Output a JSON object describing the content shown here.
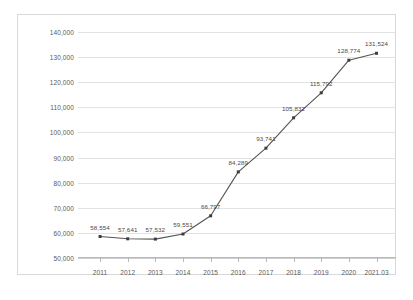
{
  "chart_data": {
    "type": "line",
    "title": "",
    "xlabel": "",
    "ylabel": "",
    "categories": [
      "2011",
      "2012",
      "2013",
      "2014",
      "2015",
      "2016",
      "2017",
      "2018",
      "2019",
      "2020",
      "2021.03"
    ],
    "values": [
      58554,
      57641,
      57532,
      59551,
      66797,
      84289,
      93741,
      105832,
      115792,
      128774,
      131524
    ],
    "value_labels": [
      "58,554",
      "57,641",
      "57,532",
      "59,551",
      "66,797",
      "84,289",
      "93,741",
      "105,832",
      "115,792",
      "128,774",
      "131,524"
    ],
    "ylim": [
      50000,
      140000
    ],
    "ytick_values": [
      50000,
      60000,
      70000,
      80000,
      90000,
      100000,
      110000,
      120000,
      130000,
      140000
    ],
    "ytick_labels": [
      "50,000",
      "60,000",
      "70,000",
      "80,000",
      "90,000",
      "100,000",
      "110,000",
      "120,000",
      "130,000",
      "140,000"
    ],
    "grid": true,
    "legend": "none",
    "series_color": "#545454",
    "marker": "square",
    "marker_color": "#3d3d3d",
    "gridline_color": "#e2e2e2",
    "frame_color": "#d8d8d8",
    "axis_color": "#b9b9b9",
    "label_color": "#5a5a5a"
  }
}
